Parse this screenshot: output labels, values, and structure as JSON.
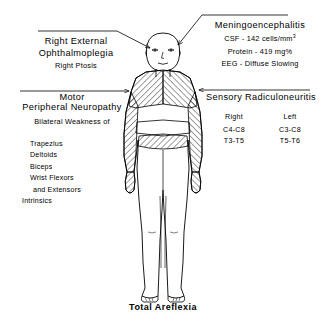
{
  "diagram": {
    "caption": "Total Areflexia",
    "line_color": "#000000"
  },
  "annotations": {
    "ophthalmoplegia": {
      "title_line1": "Right External",
      "title_line2": "Ophthalmoplegia",
      "subtitle": "Right Ptosis",
      "pointer": "arrow-to-head-right"
    },
    "meningoencephalitis": {
      "title": "Meningoencephalitis",
      "findings": [
        {
          "label": "CSF",
          "value": "142 cells/mm",
          "exponent": "3"
        },
        {
          "label": "Protein",
          "value": "419 mg%",
          "exponent": ""
        },
        {
          "label": "EEG",
          "value": "Diffuse Slowing",
          "exponent": ""
        }
      ],
      "csf_text": "CSF - 142 cells/mm",
      "csf_sup": "3",
      "protein_text": "Protein - 419 mg%",
      "eeg_text": "EEG - Diffuse Slowing",
      "pointer": "arrow-to-head-left"
    },
    "motor_neuropathy": {
      "title_line1": "Motor",
      "title_line2": "Peripheral Neuropathy",
      "subtitle": "Bilateral Weakness of",
      "muscles": [
        "Trapezius",
        "Deltoids",
        "Biceps",
        "Wrist Flexors",
        "and Extensors",
        "Intrinsics"
      ],
      "pointer": "arrow-right-to-torso"
    },
    "sensory_radiculoneuritis": {
      "title": "Sensory Radiculoneuritis",
      "columns": [
        "Right",
        "Left"
      ],
      "rows": [
        [
          "C4-C8",
          "C3-C8"
        ],
        [
          "T3-T5",
          "T5-T6"
        ]
      ],
      "pointer": "arrow-left-to-torso"
    }
  }
}
